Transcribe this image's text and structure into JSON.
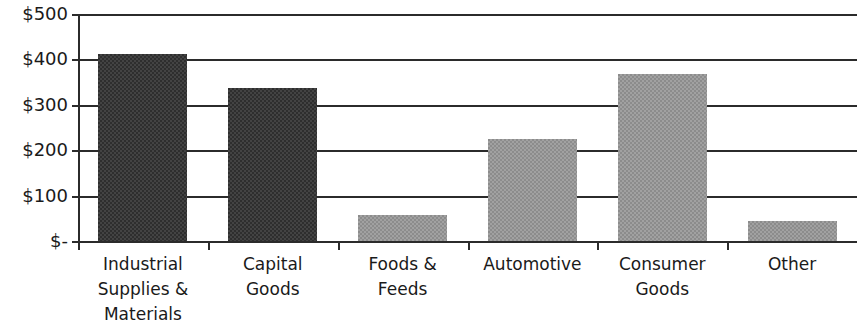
{
  "chart_data": {
    "type": "bar",
    "title": "",
    "subtitle": "",
    "xlabel": "",
    "ylabel": "",
    "categories": [
      "Industrial\nSupplies &\nMaterials",
      "Capital\nGoods",
      "Foods &\nFeeds",
      "Automotive",
      "Consumer\nGoods",
      "Other"
    ],
    "values": [
      412,
      337,
      57,
      224,
      368,
      44
    ],
    "ylim": [
      0,
      500
    ],
    "ytick_values": [
      0,
      100,
      200,
      300,
      400,
      500
    ],
    "ytick_labels": [
      "$-",
      "$100",
      "$200",
      "$300",
      "$400",
      "$500"
    ],
    "grid": true,
    "legend": false,
    "series": [
      {
        "name": "Value",
        "values": [
          412,
          337,
          57,
          224,
          368,
          44
        ],
        "colors": [
          "#2e2e2e",
          "#2e2e2e",
          "#8c8c8c",
          "#8c8c8c",
          "#8c8c8c",
          "#8c8c8c"
        ]
      }
    ],
    "colors": {
      "dark_bar": "#2e2e2e",
      "light_bar": "#8c8c8c",
      "axis": "#2b2b2b",
      "background": "#ffffff",
      "text": "#1a1a1a"
    }
  }
}
